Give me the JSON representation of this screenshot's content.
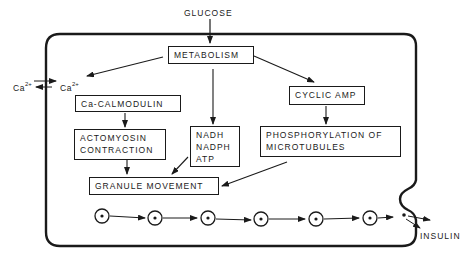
{
  "diagram": {
    "input_label": "GLUCOSE",
    "output_label": "INSULIN",
    "calcium": {
      "outside": "Ca",
      "outside_sup": "2+",
      "inside": "Ca",
      "inside_sup": "2+"
    },
    "nodes": {
      "metabolism": "METABOLISM",
      "ca_calmodulin": "Ca-CALMODULIN",
      "actomyosin": [
        "ACTOMYOSIN",
        "CONTRACTION"
      ],
      "energy": [
        "NADH",
        "NADPH",
        "ATP"
      ],
      "cyclic_amp": "CYCLIC AMP",
      "phosphorylation": [
        "PHOSPHORYLATION OF",
        "MICROTUBULES"
      ],
      "granule_movement": "GRANULE MOVEMENT"
    },
    "edges": [
      {
        "from": "GLUCOSE",
        "to": "METABOLISM"
      },
      {
        "from": "METABOLISM",
        "to": "Ca2+ (intracellular)"
      },
      {
        "from": "METABOLISM",
        "to": "NADH/NADPH/ATP"
      },
      {
        "from": "METABOLISM",
        "to": "CYCLIC AMP"
      },
      {
        "from": "Ca-CALMODULIN",
        "to": "ACTOMYOSIN CONTRACTION"
      },
      {
        "from": "ACTOMYOSIN CONTRACTION",
        "to": "GRANULE MOVEMENT"
      },
      {
        "from": "NADH/NADPH/ATP",
        "to": "GRANULE MOVEMENT"
      },
      {
        "from": "CYCLIC AMP",
        "to": "PHOSPHORYLATION OF MICROTUBULES"
      },
      {
        "from": "PHOSPHORYLATION OF MICROTUBULES",
        "to": "GRANULE MOVEMENT"
      },
      {
        "from": "granules",
        "to": "INSULIN (exocytosis)"
      }
    ],
    "granule_count": 6,
    "colors": {
      "ink": "#1a1a1a",
      "background": "#ffffff"
    }
  }
}
